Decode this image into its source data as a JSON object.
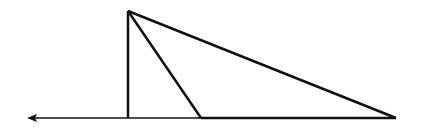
{
  "diagram": {
    "type": "geometry-triangles",
    "colors": {
      "stroke": "#111111",
      "background": "#ffffff"
    },
    "points": {
      "apex": [
        128,
        11
      ],
      "foot_vertical": [
        128,
        118
      ],
      "foot_middle": [
        201,
        118
      ],
      "foot_right": [
        396,
        118
      ],
      "arrow_tip": [
        27,
        118
      ]
    },
    "segments": [
      {
        "name": "vertical-altitude",
        "from": "apex",
        "to": "foot_vertical"
      },
      {
        "name": "inner-slant",
        "from": "apex",
        "to": "foot_middle"
      },
      {
        "name": "outer-slant",
        "from": "apex",
        "to": "foot_right"
      },
      {
        "name": "base-segment",
        "from": "foot_middle",
        "to": "foot_right"
      },
      {
        "name": "ray-left",
        "from": "foot_middle",
        "to": "arrow_tip",
        "arrow": true
      }
    ],
    "labels": []
  }
}
